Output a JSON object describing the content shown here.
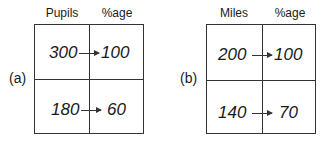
{
  "panels": [
    {
      "label": "(a)",
      "col_headers": [
        "Pupils",
        "%age"
      ],
      "rows": [
        {
          "left": "300",
          "right": "100"
        },
        {
          "left": "180",
          "right": "60"
        }
      ]
    },
    {
      "label": "(b)",
      "col_headers": [
        "Miles",
        "%age"
      ],
      "rows": [
        {
          "left": "200",
          "right": "100"
        },
        {
          "left": "140",
          "right": "70"
        }
      ]
    }
  ]
}
